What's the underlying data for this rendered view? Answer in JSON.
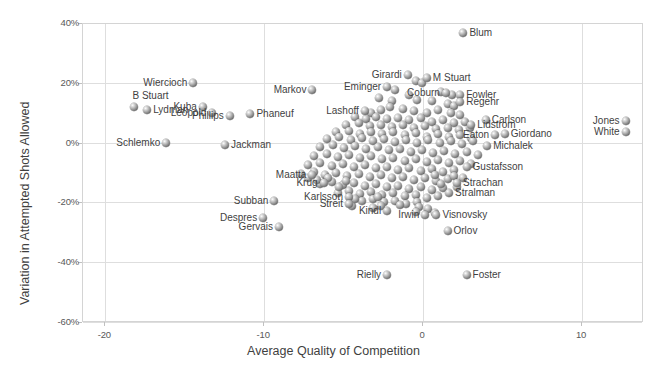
{
  "chart_data": {
    "type": "scatter",
    "title": "",
    "xlabel": "Average Quality of Competition",
    "ylabel": "Variation in Attempted Shots Allowed",
    "xlim": [
      -21.4,
      13.9
    ],
    "ylim": [
      -0.6,
      0.4
    ],
    "xticks": [
      -20,
      -10,
      0,
      10
    ],
    "xticklabels": [
      "-20",
      "-10",
      "0",
      "10"
    ],
    "yticks": [
      0.4,
      0.2,
      0.0,
      -0.2,
      -0.4,
      -0.6
    ],
    "yticklabels": [
      "40%",
      "20%",
      "0%",
      "-20%",
      "-40%",
      "-60%"
    ],
    "grid": "horizontal-and-vertical",
    "legend": "none",
    "marker": "3d-sphere-gray",
    "labeled_points": [
      {
        "name": "Blum",
        "x": 2.6,
        "y": 0.365,
        "side": "l"
      },
      {
        "name": "Girardi",
        "x": -0.9,
        "y": 0.225,
        "side": "r"
      },
      {
        "name": "M Stuart",
        "x": 0.3,
        "y": 0.215,
        "side": "l"
      },
      {
        "name": "Wiercioch",
        "x": -14.4,
        "y": 0.2,
        "side": "r"
      },
      {
        "name": "Markov",
        "x": -6.9,
        "y": 0.175,
        "side": "r"
      },
      {
        "name": "Eminger",
        "x": -2.2,
        "y": 0.185,
        "side": "r"
      },
      {
        "name": "Coburn",
        "x": 1.5,
        "y": 0.165,
        "side": "r"
      },
      {
        "name": "Fowler",
        "x": 2.4,
        "y": 0.16,
        "side": "l"
      },
      {
        "name": "Regehr",
        "x": 2.4,
        "y": 0.135,
        "side": "l"
      },
      {
        "name": "B Stuart",
        "x": -18.1,
        "y": 0.118,
        "side": "c"
      },
      {
        "name": "Kuba",
        "x": -13.8,
        "y": 0.12,
        "side": "r"
      },
      {
        "name": "Lydman",
        "x": -17.3,
        "y": 0.108,
        "side": "l"
      },
      {
        "name": "Leopold",
        "x": -13.2,
        "y": 0.1,
        "side": "r"
      },
      {
        "name": "Phillips",
        "x": -12.1,
        "y": 0.09,
        "side": "r"
      },
      {
        "name": "Phaneuf",
        "x": -10.8,
        "y": 0.095,
        "side": "l"
      },
      {
        "name": "Lashoff",
        "x": -3.6,
        "y": 0.105,
        "side": "r"
      },
      {
        "name": "Carlson",
        "x": 4.0,
        "y": 0.075,
        "side": "l"
      },
      {
        "name": "Lidstrom",
        "x": 3.1,
        "y": 0.06,
        "side": "l"
      },
      {
        "name": "Jones",
        "x": 12.8,
        "y": 0.072,
        "side": "r"
      },
      {
        "name": "White",
        "x": 12.8,
        "y": 0.035,
        "side": "r"
      },
      {
        "name": "Giordano",
        "x": 5.2,
        "y": 0.03,
        "side": "l"
      },
      {
        "name": "Eaton",
        "x": 4.6,
        "y": 0.024,
        "side": "r"
      },
      {
        "name": "Michalek",
        "x": 4.1,
        "y": -0.01,
        "side": "l"
      },
      {
        "name": "Schlemko",
        "x": -16.1,
        "y": -0.002,
        "side": "r"
      },
      {
        "name": "Jackman",
        "x": -12.4,
        "y": -0.008,
        "side": "l"
      },
      {
        "name": "Gustafsson",
        "x": 2.8,
        "y": -0.08,
        "side": "l"
      },
      {
        "name": "Maatta",
        "x": -6.9,
        "y": -0.108,
        "side": "r"
      },
      {
        "name": "Krug",
        "x": -6.2,
        "y": -0.135,
        "side": "r"
      },
      {
        "name": "Strachan",
        "x": 2.2,
        "y": -0.135,
        "side": "l"
      },
      {
        "name": "Subban",
        "x": -9.3,
        "y": -0.195,
        "side": "r"
      },
      {
        "name": "Karlsson",
        "x": -4.6,
        "y": -0.183,
        "side": "r"
      },
      {
        "name": "Streit",
        "x": -4.6,
        "y": -0.205,
        "side": "r"
      },
      {
        "name": "Stralman",
        "x": 1.7,
        "y": -0.168,
        "side": "l"
      },
      {
        "name": "Despres",
        "x": -10.0,
        "y": -0.253,
        "side": "r"
      },
      {
        "name": "Gervais",
        "x": -9.0,
        "y": -0.283,
        "side": "r"
      },
      {
        "name": "Kindl",
        "x": -2.2,
        "y": -0.228,
        "side": "r"
      },
      {
        "name": "Irwin",
        "x": 0.2,
        "y": -0.243,
        "side": "r"
      },
      {
        "name": "Visnovsky",
        "x": 0.9,
        "y": -0.243,
        "side": "l"
      },
      {
        "name": "Orlov",
        "x": 1.6,
        "y": -0.295,
        "side": "l"
      },
      {
        "name": "Rielly",
        "x": -2.2,
        "y": -0.443,
        "side": "r"
      },
      {
        "name": "Foster",
        "x": 2.8,
        "y": -0.443,
        "side": "l"
      }
    ],
    "unlabeled_points": [
      [
        -0.4,
        0.205
      ],
      [
        0.0,
        0.198
      ],
      [
        -1.7,
        0.175
      ],
      [
        -0.8,
        0.16
      ],
      [
        1.2,
        0.168
      ],
      [
        1.9,
        0.16
      ],
      [
        -2.7,
        0.148
      ],
      [
        -1.9,
        0.14
      ],
      [
        -0.3,
        0.142
      ],
      [
        0.6,
        0.138
      ],
      [
        1.6,
        0.13
      ],
      [
        2.0,
        0.122
      ],
      [
        -3.2,
        0.098
      ],
      [
        -2.6,
        0.108
      ],
      [
        -2.0,
        0.118
      ],
      [
        -1.2,
        0.112
      ],
      [
        -0.5,
        0.105
      ],
      [
        0.3,
        0.1
      ],
      [
        1.0,
        0.108
      ],
      [
        1.8,
        0.098
      ],
      [
        2.4,
        0.092
      ],
      [
        -4.2,
        0.085
      ],
      [
        -3.5,
        0.078
      ],
      [
        -2.9,
        0.086
      ],
      [
        -2.2,
        0.078
      ],
      [
        -1.5,
        0.082
      ],
      [
        -0.8,
        0.074
      ],
      [
        -0.1,
        0.082
      ],
      [
        0.6,
        0.07
      ],
      [
        1.3,
        0.076
      ],
      [
        2.0,
        0.064
      ],
      [
        2.7,
        0.07
      ],
      [
        -4.8,
        0.06
      ],
      [
        -4.0,
        0.064
      ],
      [
        -3.3,
        0.056
      ],
      [
        -2.6,
        0.06
      ],
      [
        -1.9,
        0.052
      ],
      [
        -1.2,
        0.058
      ],
      [
        -0.5,
        0.048
      ],
      [
        0.2,
        0.056
      ],
      [
        0.9,
        0.044
      ],
      [
        1.6,
        0.05
      ],
      [
        2.3,
        0.042
      ],
      [
        3.0,
        0.048
      ],
      [
        -5.4,
        0.035
      ],
      [
        -4.6,
        0.04
      ],
      [
        -3.9,
        0.03
      ],
      [
        -3.2,
        0.036
      ],
      [
        -2.5,
        0.028
      ],
      [
        -1.8,
        0.034
      ],
      [
        -1.1,
        0.024
      ],
      [
        -0.4,
        0.032
      ],
      [
        0.3,
        0.02
      ],
      [
        1.0,
        0.028
      ],
      [
        1.7,
        0.018
      ],
      [
        2.4,
        0.026
      ],
      [
        3.1,
        0.016
      ],
      [
        -6.0,
        0.012
      ],
      [
        -5.2,
        0.018
      ],
      [
        -4.5,
        0.008
      ],
      [
        -3.8,
        0.014
      ],
      [
        -3.1,
        0.004
      ],
      [
        -2.4,
        0.012
      ],
      [
        -1.7,
        0.002
      ],
      [
        -1.0,
        0.01
      ],
      [
        -0.3,
        0.0
      ],
      [
        0.4,
        0.008
      ],
      [
        1.1,
        -0.002
      ],
      [
        1.8,
        0.006
      ],
      [
        2.5,
        -0.004
      ],
      [
        3.2,
        0.004
      ],
      [
        -6.4,
        -0.014
      ],
      [
        -5.6,
        -0.008
      ],
      [
        -4.9,
        -0.018
      ],
      [
        -4.2,
        -0.012
      ],
      [
        -3.5,
        -0.022
      ],
      [
        -2.8,
        -0.016
      ],
      [
        -2.1,
        -0.026
      ],
      [
        -1.4,
        -0.02
      ],
      [
        -0.7,
        -0.03
      ],
      [
        0.0,
        -0.024
      ],
      [
        0.7,
        -0.034
      ],
      [
        1.4,
        -0.028
      ],
      [
        2.1,
        -0.038
      ],
      [
        2.8,
        -0.032
      ],
      [
        3.5,
        -0.042
      ],
      [
        -6.8,
        -0.044
      ],
      [
        -6.0,
        -0.038
      ],
      [
        -5.3,
        -0.048
      ],
      [
        -4.6,
        -0.042
      ],
      [
        -3.9,
        -0.052
      ],
      [
        -3.2,
        -0.046
      ],
      [
        -2.5,
        -0.056
      ],
      [
        -1.8,
        -0.05
      ],
      [
        -1.1,
        -0.06
      ],
      [
        -0.4,
        -0.054
      ],
      [
        0.3,
        -0.064
      ],
      [
        1.0,
        -0.058
      ],
      [
        1.7,
        -0.068
      ],
      [
        2.4,
        -0.062
      ],
      [
        3.1,
        -0.072
      ],
      [
        -7.2,
        -0.074
      ],
      [
        -6.4,
        -0.068
      ],
      [
        -5.7,
        -0.078
      ],
      [
        -5.0,
        -0.072
      ],
      [
        -4.3,
        -0.082
      ],
      [
        -3.6,
        -0.076
      ],
      [
        -2.9,
        -0.086
      ],
      [
        -2.2,
        -0.08
      ],
      [
        -1.5,
        -0.09
      ],
      [
        -0.8,
        -0.084
      ],
      [
        -0.1,
        -0.094
      ],
      [
        0.6,
        -0.088
      ],
      [
        1.3,
        -0.098
      ],
      [
        2.0,
        -0.092
      ],
      [
        -7.6,
        -0.104
      ],
      [
        -6.8,
        -0.098
      ],
      [
        -6.1,
        -0.108
      ],
      [
        -5.4,
        -0.102
      ],
      [
        -4.7,
        -0.112
      ],
      [
        -4.0,
        -0.106
      ],
      [
        -3.3,
        -0.116
      ],
      [
        -2.6,
        -0.11
      ],
      [
        -1.9,
        -0.12
      ],
      [
        -1.2,
        -0.114
      ],
      [
        -0.5,
        -0.124
      ],
      [
        0.2,
        -0.118
      ],
      [
        0.9,
        -0.128
      ],
      [
        1.6,
        -0.122
      ],
      [
        -6.4,
        -0.138
      ],
      [
        -5.7,
        -0.132
      ],
      [
        -5.0,
        -0.142
      ],
      [
        -4.3,
        -0.136
      ],
      [
        -3.6,
        -0.146
      ],
      [
        -2.9,
        -0.14
      ],
      [
        -2.2,
        -0.15
      ],
      [
        -1.5,
        -0.144
      ],
      [
        -0.8,
        -0.154
      ],
      [
        -0.1,
        -0.148
      ],
      [
        0.6,
        -0.158
      ],
      [
        1.3,
        -0.152
      ],
      [
        -5.3,
        -0.168
      ],
      [
        -4.6,
        -0.162
      ],
      [
        -3.9,
        -0.172
      ],
      [
        -3.2,
        -0.166
      ],
      [
        -2.5,
        -0.176
      ],
      [
        -1.8,
        -0.17
      ],
      [
        -1.1,
        -0.18
      ],
      [
        -0.4,
        -0.174
      ],
      [
        0.3,
        -0.184
      ],
      [
        1.0,
        -0.178
      ],
      [
        -3.8,
        -0.196
      ],
      [
        -3.1,
        -0.19
      ],
      [
        -2.4,
        -0.2
      ],
      [
        -1.7,
        -0.194
      ],
      [
        -1.0,
        -0.204
      ],
      [
        -0.3,
        -0.198
      ],
      [
        -4.4,
        -0.212
      ],
      [
        -3.1,
        -0.218
      ],
      [
        -2.6,
        -0.212
      ],
      [
        -1.4,
        -0.21
      ],
      [
        -0.2,
        -0.216
      ],
      [
        0.4,
        -0.222
      ],
      [
        -0.4,
        -0.232
      ],
      [
        0.8,
        -0.236
      ],
      [
        -5.2,
        -0.15
      ],
      [
        -4.8,
        -0.128
      ],
      [
        -7.2,
        -0.12
      ],
      [
        -6.6,
        -0.126
      ],
      [
        -5.9,
        -0.118
      ],
      [
        2.0,
        -0.112
      ],
      [
        2.6,
        -0.12
      ],
      [
        1.2,
        -0.14
      ],
      [
        2.2,
        -0.148
      ],
      [
        0.8,
        -0.108
      ],
      [
        -4.2,
        -0.188
      ],
      [
        -2.8,
        -0.182
      ]
    ]
  }
}
